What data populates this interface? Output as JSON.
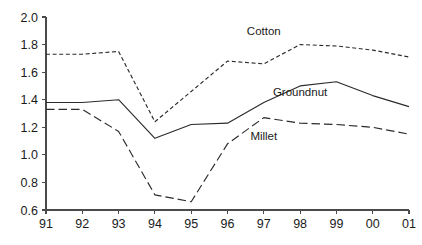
{
  "chart_data": {
    "type": "line",
    "title": "",
    "subtitle": "",
    "xlabel": "",
    "ylabel": "",
    "x": [
      "91",
      "92",
      "93",
      "94",
      "95",
      "96",
      "97",
      "98",
      "99",
      "00",
      "01"
    ],
    "categories": [
      "91",
      "92",
      "93",
      "94",
      "95",
      "96",
      "97",
      "98",
      "99",
      "00",
      "01"
    ],
    "xlim": [
      0,
      10
    ],
    "ylim": [
      0.6,
      2.0
    ],
    "y_ticks": [
      "2.0",
      "1.8",
      "1.6",
      "1.4",
      "1.2",
      "1.0",
      "0.8",
      "0.6"
    ],
    "y_tick_values": [
      2.0,
      1.8,
      1.6,
      1.4,
      1.2,
      1.0,
      0.8,
      0.6
    ],
    "grid": false,
    "legend": "inline-annotations",
    "legend_position": "inline",
    "background_color": "#ffffff",
    "axis_color": "#4a4a4a",
    "series": [
      {
        "name": "Cotton",
        "label": "Cotton",
        "color": "#2b2b2b",
        "dash": "dotted",
        "dash_array": "4,2.6",
        "values": [
          1.73,
          1.73,
          1.75,
          1.24,
          1.46,
          1.68,
          1.66,
          1.8,
          1.79,
          1.76,
          1.71
        ],
        "label_x": "97",
        "label_y": 1.87
      },
      {
        "name": "Groundnut",
        "label": "Groundnut",
        "color": "#2b2b2b",
        "dash": "solid",
        "dash_array": "",
        "values": [
          1.38,
          1.38,
          1.4,
          1.12,
          1.22,
          1.23,
          1.38,
          1.5,
          1.53,
          1.43,
          1.35
        ],
        "label_x": "98",
        "label_y": 1.43
      },
      {
        "name": "Millet",
        "label": "Millet",
        "color": "#2b2b2b",
        "dash": "dashed",
        "dash_array": "8.5,4",
        "values": [
          1.33,
          1.33,
          1.17,
          0.71,
          0.66,
          1.08,
          1.27,
          1.23,
          1.22,
          1.2,
          1.15
        ],
        "label_x": "97",
        "label_y": 1.11
      }
    ]
  }
}
